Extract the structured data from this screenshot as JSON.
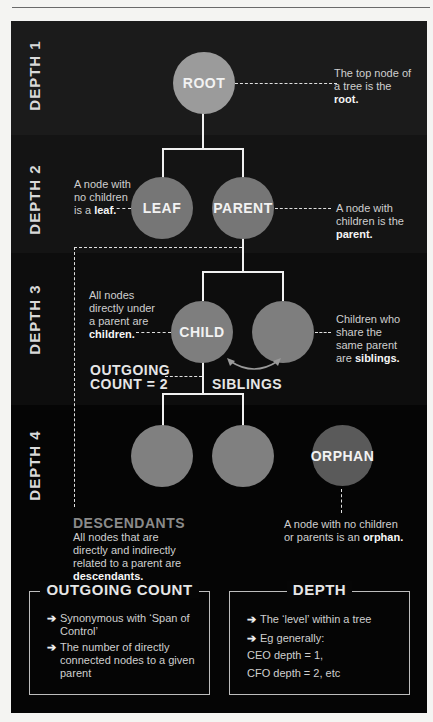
{
  "diagram": {
    "depth_labels": [
      "DEPTH 1",
      "DEPTH 2",
      "DEPTH 3",
      "DEPTH 4"
    ],
    "nodes": {
      "root": {
        "label": "ROOT",
        "color": "#9b9b9b"
      },
      "leaf": {
        "label": "LEAF",
        "color": "#767676"
      },
      "parent": {
        "label": "PARENT",
        "color": "#767676"
      },
      "child": {
        "label": "CHILD",
        "color": "#7e7e7e"
      },
      "sibling": {
        "label": "",
        "color": "#7e7e7e"
      },
      "grandchild_1": {
        "label": "",
        "color": "#808080"
      },
      "grandchild_2": {
        "label": "",
        "color": "#808080"
      },
      "orphan": {
        "label": "ORPHAN",
        "color": "#5a5a5a"
      }
    },
    "annotations": {
      "root": {
        "pre": "The top node of a tree is the ",
        "bold": "root."
      },
      "leaf": {
        "pre": "A node with no children is a ",
        "bold": "leaf."
      },
      "parent": {
        "pre": "A node with children is the ",
        "bold": "parent."
      },
      "children": {
        "pre": "All nodes directly under a parent are ",
        "bold": "children."
      },
      "siblings": {
        "pre": "Children who share the same parent are ",
        "bold": "siblings."
      },
      "outgoing_line1": "OUTGOING",
      "outgoing_line2": "COUNT = 2",
      "siblings_label": "SIBLINGS",
      "descendants_title": "DESCENDANTS",
      "descendants": {
        "pre": "All nodes that are directly and indirectly related to a parent are ",
        "bold": "descendants."
      },
      "orphan": {
        "pre": "A node with no children or parents is an ",
        "bold": "orphan."
      }
    }
  },
  "boxes": {
    "outgoing_count": {
      "title": "OUTGOING COUNT",
      "items": [
        "Synonymous with ‘Span of Control’",
        "The number of directly connected nodes to a given parent"
      ]
    },
    "depth": {
      "title": "DEPTH",
      "items": [
        "The ‘level’ within a tree",
        "Eg generally:"
      ],
      "lines": [
        "CEO depth = 1,",
        "CFO depth = 2, etc"
      ]
    }
  },
  "icons": {
    "bullet": "arrow-right-icon",
    "bullet_glyph": "➔"
  }
}
